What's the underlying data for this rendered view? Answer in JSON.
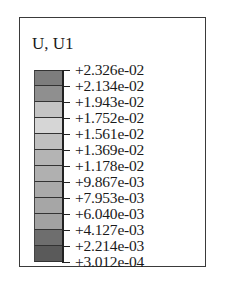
{
  "chart_data": {
    "type": "heatmap",
    "title": "U, U1",
    "legend_kind": "contour-colorbar",
    "tick_labels": [
      "+2.326e-02",
      "+2.134e-02",
      "+1.943e-02",
      "+1.752e-02",
      "+1.561e-02",
      "+1.369e-02",
      "+1.178e-02",
      "+9.867e-03",
      "+7.953e-03",
      "+6.040e-03",
      "+4.127e-03",
      "+2.214e-03",
      "+3.012e-04"
    ],
    "values": [
      0.02326,
      0.02134,
      0.01943,
      0.01752,
      0.01561,
      0.01369,
      0.01178,
      0.009867,
      0.007953,
      0.00604,
      0.004127,
      0.002214,
      0.0003012
    ],
    "range": [
      0.0003012,
      0.02326
    ],
    "swatch_colors": [
      "#7d7d7d",
      "#8f8f8f",
      "#c4c4c4",
      "#d6d6d6",
      "#c0c0c0",
      "#b4b4b4",
      "#b0b0b0",
      "#aaaaaa",
      "#a6a6a6",
      "#a2a2a2",
      "#6e6e6e",
      "#5a5a5a"
    ]
  },
  "legend": {
    "title": "U, U1"
  }
}
